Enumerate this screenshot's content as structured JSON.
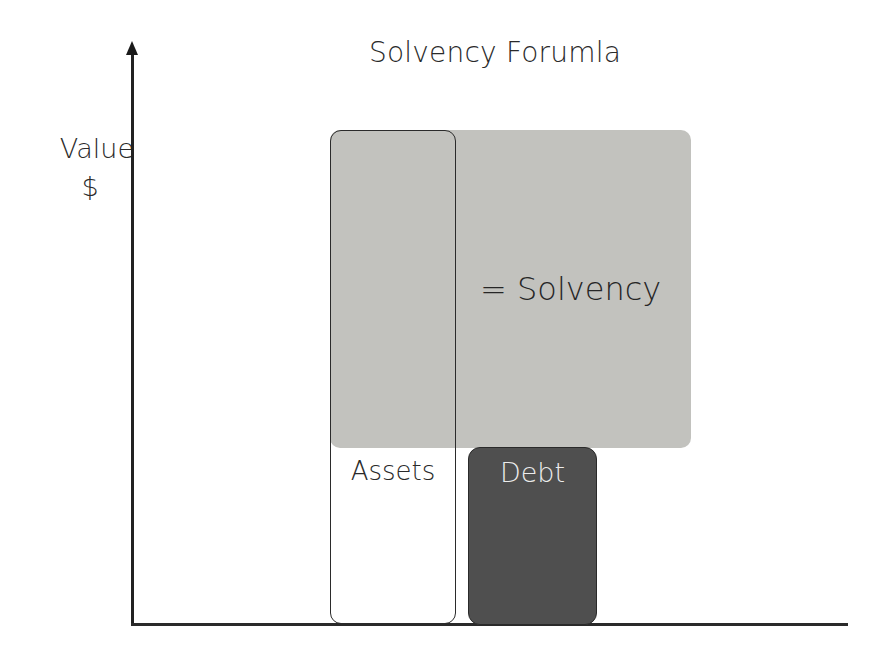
{
  "diagram": {
    "title": "Solvency Forumla",
    "y_axis": {
      "label": "Value",
      "unit": "$"
    },
    "solvency_region": {
      "label": "= Solvency",
      "color": "#c2c2be"
    },
    "assets": {
      "label": "Assets",
      "fill": "#ffffff",
      "outline": "#2b2b2b"
    },
    "debt": {
      "label": "Debt",
      "color": "#4f4f4f",
      "text_color": "#ececec"
    }
  }
}
